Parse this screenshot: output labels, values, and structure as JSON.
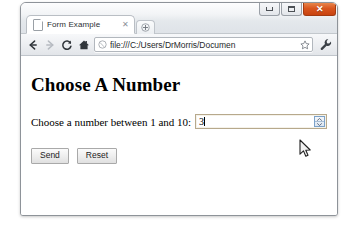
{
  "window": {
    "controls": {
      "minimize_label": "Minimize",
      "maximize_label": "Maximize",
      "close_label": "✕"
    },
    "close_color": "#d9561f"
  },
  "tabs": [
    {
      "title": "Form Example",
      "close_label": "✕",
      "favicon": "page-icon"
    }
  ],
  "new_tab": {
    "label": "+",
    "icon": "plus-icon"
  },
  "toolbar": {
    "back_icon": "back-arrow-icon",
    "forward_icon": "forward-arrow-icon",
    "reload_icon": "reload-icon",
    "home_icon": "home-icon",
    "site_icon": "globe-icon",
    "url": "file:///C:/Users/DrMorris/Documen",
    "url_placeholder": "Search or type URL",
    "bookmark_icon": "star-icon",
    "menu_icon": "wrench-icon"
  },
  "page": {
    "heading": "Choose A Number",
    "field_label": "Choose a number between 1 and 10:",
    "number_input": {
      "value": "3",
      "placeholder": "",
      "min": "1",
      "max": "10",
      "spinner_up_icon": "chevron-up-icon",
      "spinner_down_icon": "chevron-down-icon"
    },
    "buttons": {
      "submit_label": "Send",
      "reset_label": "Reset"
    }
  },
  "cursor": {
    "icon": "mouse-pointer-icon"
  }
}
